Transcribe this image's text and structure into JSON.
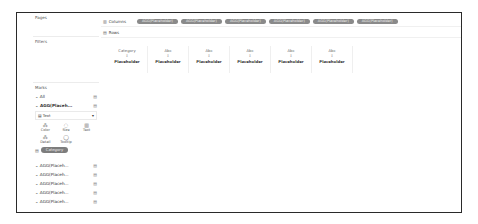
{
  "cards": {
    "pages_title": "Pages",
    "filters_title": "Filters",
    "marks_title": "Marks"
  },
  "marks": {
    "all_label": "All",
    "agg_primary_label": "AGG(Placeh...",
    "mark_type": "Text",
    "buttons": [
      {
        "label": "Color",
        "icon": "color-icon"
      },
      {
        "label": "Size",
        "icon": "size-icon"
      },
      {
        "label": "Text",
        "icon": "text-icon"
      },
      {
        "label": "Detail",
        "icon": "detail-icon"
      },
      {
        "label": "Tooltip",
        "icon": "tooltip-icon"
      }
    ],
    "category_pill": "Category",
    "agg_items": [
      {
        "label": "AGG(Placeh..."
      },
      {
        "label": "AGG(Placeh..."
      },
      {
        "label": "AGG(Placeh..."
      },
      {
        "label": "AGG(Placeh..."
      },
      {
        "label": "AGG(Placeh..."
      }
    ]
  },
  "shelves": {
    "columns_label": "Columns",
    "rows_label": "Rows",
    "column_pills": [
      "AGG(Placeholder)",
      "AGG(Placeholder)",
      "AGG(Placeholder)",
      "AGG(Placeholder)",
      "AGG(Placeholder)",
      "AGG(Placeholder)"
    ]
  },
  "view": {
    "headers": [
      {
        "title": "Category",
        "indicator": "↕",
        "value": "Placeholder"
      },
      {
        "title": "Abc",
        "indicator": "↕",
        "value": "Placeholder"
      },
      {
        "title": "Abc",
        "indicator": "↕",
        "value": "Placeholder"
      },
      {
        "title": "Abc",
        "indicator": "↕",
        "value": "Placeholder"
      },
      {
        "title": "Abc",
        "indicator": "↕",
        "value": "Placeholder"
      },
      {
        "title": "Abc",
        "indicator": "↕",
        "value": "Placeholder"
      }
    ]
  },
  "colors": {
    "pill": "#8a8a8a",
    "frame": "#2a2a2a"
  }
}
